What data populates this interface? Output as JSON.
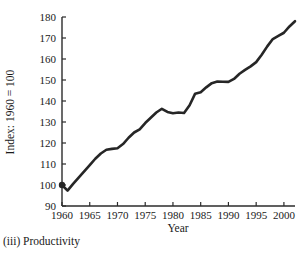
{
  "caption": "(iii) Productivity",
  "chart_data": {
    "type": "line",
    "title": "",
    "subtitle": "",
    "xlabel": "Year",
    "ylabel": "Index: 1960 = 100",
    "xlim": [
      1960,
      2002
    ],
    "ylim": [
      90,
      180
    ],
    "xticks": [
      1960,
      1965,
      1970,
      1975,
      1980,
      1985,
      1990,
      1995,
      2000
    ],
    "xtick_labels": [
      "1960",
      "1965",
      "1970",
      "1975",
      "1980",
      "1985",
      "1990",
      "1995",
      "2000"
    ],
    "yticks": [
      90,
      100,
      110,
      120,
      130,
      140,
      150,
      160,
      170,
      180
    ],
    "ytick_labels": [
      "90",
      "100",
      "110",
      "120",
      "130",
      "140",
      "150",
      "160",
      "170",
      "180"
    ],
    "grid": false,
    "legend": "none",
    "line_color": "#262626",
    "line_width": 2.6,
    "series": [
      {
        "name": "Productivity index",
        "x": [
          1960,
          1961,
          1962,
          1963,
          1964,
          1965,
          1966,
          1967,
          1968,
          1969,
          1970,
          1971,
          1972,
          1973,
          1974,
          1975,
          1976,
          1977,
          1978,
          1979,
          1980,
          1981,
          1982,
          1983,
          1984,
          1985,
          1986,
          1987,
          1988,
          1989,
          1990,
          1991,
          1992,
          1993,
          1994,
          1995,
          1996,
          1997,
          1998,
          1999,
          2000,
          2001,
          2002
        ],
        "values": [
          100.0,
          97.3,
          100.5,
          103.5,
          106.5,
          109.5,
          112.5,
          115.0,
          116.8,
          117.2,
          117.5,
          119.5,
          122.5,
          125.0,
          126.5,
          129.5,
          132.0,
          134.5,
          136.3,
          134.8,
          134.2,
          134.5,
          134.3,
          138.0,
          143.5,
          144.2,
          146.5,
          148.5,
          149.3,
          149.2,
          149.1,
          150.5,
          153.0,
          154.8,
          156.5,
          158.5,
          162.0,
          166.0,
          169.5,
          171.0,
          172.5,
          175.5,
          178.0
        ]
      }
    ],
    "annotations": [
      {
        "label": "start marker",
        "x": 1960,
        "y": 100.0
      }
    ]
  }
}
